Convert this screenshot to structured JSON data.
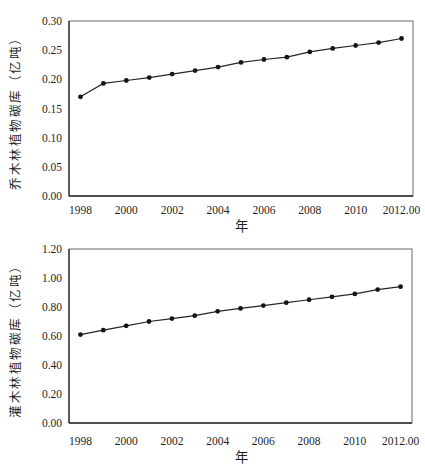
{
  "chart_data": [
    {
      "type": "line",
      "title": "",
      "series_name": "乔木林植物碳库",
      "ylabel": "乔木林植物碳库（亿吨）",
      "xlabel": "年",
      "x": [
        1998,
        1999,
        2000,
        2001,
        2002,
        2003,
        2004,
        2005,
        2006,
        2007,
        2008,
        2009,
        2010,
        2011,
        2012
      ],
      "values": [
        0.17,
        0.193,
        0.198,
        0.203,
        0.209,
        0.215,
        0.221,
        0.229,
        0.234,
        0.238,
        0.247,
        0.253,
        0.258,
        0.263,
        0.27
      ],
      "xlim": [
        1997.5,
        2012.5
      ],
      "ylim": [
        0,
        0.3
      ],
      "y_ticks": {
        "values": [
          0,
          0.05,
          0.1,
          0.15,
          0.2,
          0.25,
          0.3
        ],
        "labels": [
          "0.00",
          "0.05",
          "0.10",
          "0.15",
          "0.20",
          "0.25",
          "0.30"
        ]
      },
      "x_ticks": {
        "values": [
          1998,
          2000,
          2002,
          2004,
          2006,
          2008,
          2010,
          2012
        ],
        "labels": [
          "1998",
          "2000",
          "2002",
          "2004",
          "2006",
          "2008",
          "2010",
          "2012.00"
        ]
      },
      "grid": false,
      "legend": null,
      "marker": "filled-circle",
      "line_color": "#262626",
      "marker_color": "#141414",
      "text_color": "#1f1f1f",
      "frame_color": "#6b6b6b",
      "axis_color": "#2e2e2e"
    },
    {
      "type": "line",
      "title": "",
      "series_name": "灌木林植物碳库",
      "ylabel": "灌木林植物碳库（亿吨）",
      "xlabel": "年",
      "x": [
        1998,
        1999,
        2000,
        2001,
        2002,
        2003,
        2004,
        2005,
        2006,
        2007,
        2008,
        2009,
        2010,
        2011,
        2012
      ],
      "values": [
        0.61,
        0.64,
        0.67,
        0.7,
        0.72,
        0.74,
        0.77,
        0.79,
        0.81,
        0.83,
        0.85,
        0.87,
        0.89,
        0.92,
        0.94
      ],
      "xlim": [
        1997.5,
        2012.5
      ],
      "ylim": [
        0,
        1.2
      ],
      "y_ticks": {
        "values": [
          0,
          0.2,
          0.4,
          0.6,
          0.8,
          1.0,
          1.2
        ],
        "labels": [
          "0.00",
          "0.20",
          "0.40",
          "0.60",
          "0.80",
          "1.00",
          "1.20"
        ]
      },
      "x_ticks": {
        "values": [
          1998,
          2000,
          2002,
          2004,
          2006,
          2008,
          2010,
          2012
        ],
        "labels": [
          "1998",
          "2000",
          "2002",
          "2004",
          "2006",
          "2008",
          "2010",
          "2012.00"
        ]
      },
      "grid": false,
      "legend": null,
      "marker": "filled-circle",
      "line_color": "#262626",
      "marker_color": "#141414",
      "text_color": "#1f1f1f",
      "frame_color": "#6b6b6b",
      "axis_color": "#2e2e2e"
    }
  ]
}
